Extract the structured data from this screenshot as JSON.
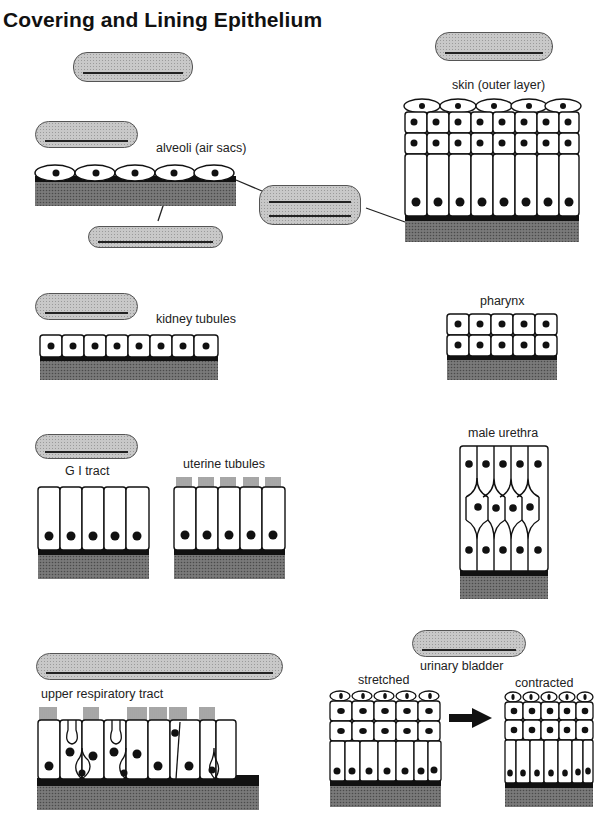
{
  "title": "Covering and Lining Epithelium",
  "labels": {
    "alveoli": "alveoli (air sacs)",
    "skin": "skin (outer layer)",
    "kidney": "kidney tubules",
    "pharynx": "pharynx",
    "gi": "G I tract",
    "uterine": "uterine tubules",
    "urethra": "male urethra",
    "respiratory": "upper respiratory tract",
    "bladder": "urinary bladder",
    "stretched": "stretched",
    "contracted": "contracted"
  },
  "blanks": [
    {
      "id": "blank-top",
      "x": 73,
      "y": 52,
      "w": 120,
      "h": 30,
      "lines": 1
    },
    {
      "id": "blank-alveoli",
      "x": 35,
      "y": 121,
      "w": 103,
      "h": 27,
      "lines": 1
    },
    {
      "id": "blank-basement",
      "x": 88,
      "y": 226,
      "w": 135,
      "h": 22,
      "lines": 1
    },
    {
      "id": "blank-center",
      "x": 259,
      "y": 185,
      "w": 102,
      "h": 40,
      "lines": 2
    },
    {
      "id": "blank-skin",
      "x": 435,
      "y": 32,
      "w": 118,
      "h": 29,
      "lines": 1
    },
    {
      "id": "blank-kidney",
      "x": 35,
      "y": 293,
      "w": 103,
      "h": 27,
      "lines": 1
    },
    {
      "id": "blank-gi",
      "x": 35,
      "y": 434,
      "w": 103,
      "h": 25,
      "lines": 1
    },
    {
      "id": "blank-respiratory",
      "x": 36,
      "y": 653,
      "w": 247,
      "h": 27,
      "lines": 1
    },
    {
      "id": "blank-bladder",
      "x": 412,
      "y": 630,
      "w": 114,
      "h": 27,
      "lines": 1
    }
  ],
  "colors": {
    "cell_fill": "#ffffff",
    "outline": "#111111",
    "nucleus": "#111111",
    "tissue": "#6e6e6e",
    "blank_fill": "#c8c8c8"
  }
}
